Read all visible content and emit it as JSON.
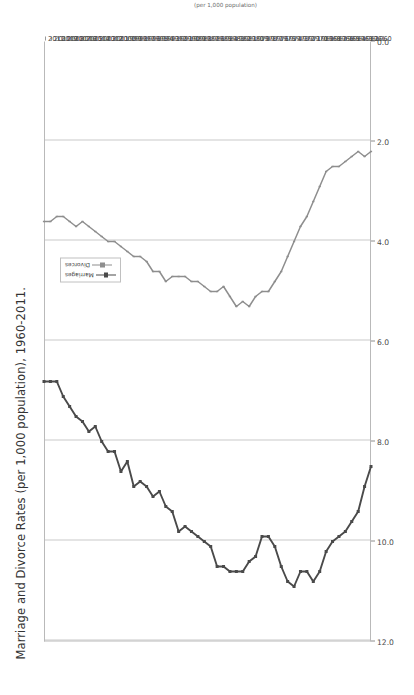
{
  "chart_data": {
    "type": "line",
    "title": "Marriage and Divorce Rates (per 1,000 population), 1960-2011.",
    "xlabel": "",
    "ylabel": "(per 1,000 population)",
    "ylim": [
      0.0,
      12.0
    ],
    "yticks": [
      "12.0",
      "10.0",
      "8.0",
      "6.0",
      "4.0",
      "2.0",
      "0.0"
    ],
    "ytick_values": [
      12.0,
      10.0,
      8.0,
      6.0,
      4.0,
      2.0,
      0.0
    ],
    "grid": true,
    "legend_position": "upper-left",
    "orientation": "rotated-90",
    "categories": [
      "1960",
      "1961",
      "1962",
      "1963",
      "1964",
      "1965",
      "1966",
      "1967",
      "1968",
      "1969",
      "1970",
      "1971",
      "1972",
      "1973",
      "1974",
      "1975",
      "1976",
      "1977",
      "1978",
      "1979",
      "1980",
      "1981",
      "1982",
      "1983",
      "1984",
      "1985",
      "1986",
      "1987",
      "1988",
      "1989",
      "1990",
      "1991",
      "1992",
      "1993",
      "1994",
      "1995",
      "1996",
      "1997",
      "1998",
      "1999",
      "2000",
      "2001",
      "2002",
      "2003",
      "2004",
      "2005",
      "2006",
      "2007",
      "2008",
      "2009",
      "2010",
      "2011"
    ],
    "series": [
      {
        "name": "Marriages",
        "color": "#4a4a4a",
        "marker": "square",
        "values": [
          8.5,
          8.9,
          9.4,
          9.6,
          9.8,
          9.9,
          10.0,
          10.2,
          10.6,
          10.8,
          10.6,
          10.6,
          10.9,
          10.8,
          10.5,
          10.1,
          9.9,
          9.9,
          10.3,
          10.4,
          10.6,
          10.6,
          10.6,
          10.5,
          10.5,
          10.1,
          10.0,
          9.9,
          9.8,
          9.7,
          9.8,
          9.4,
          9.3,
          9.0,
          9.1,
          8.9,
          8.8,
          8.9,
          8.4,
          8.6,
          8.2,
          8.2,
          8.0,
          7.7,
          7.8,
          7.6,
          7.5,
          7.3,
          7.1,
          6.8,
          6.8,
          6.8
        ]
      },
      {
        "name": "Divorces",
        "color": "#8e8e8e",
        "marker": "tick",
        "values": [
          2.2,
          2.3,
          2.2,
          2.3,
          2.4,
          2.5,
          2.5,
          2.6,
          2.9,
          3.2,
          3.5,
          3.7,
          4.0,
          4.3,
          4.6,
          4.8,
          5.0,
          5.0,
          5.1,
          5.3,
          5.2,
          5.3,
          5.1,
          4.9,
          5.0,
          5.0,
          4.9,
          4.8,
          4.8,
          4.7,
          4.7,
          4.7,
          4.8,
          4.6,
          4.6,
          4.4,
          4.3,
          4.3,
          4.2,
          4.1,
          4.0,
          4.0,
          3.9,
          3.8,
          3.7,
          3.6,
          3.7,
          3.6,
          3.5,
          3.5,
          3.6,
          3.6
        ]
      }
    ]
  },
  "title": {
    "text": "Marriage and Divorce Rates (per 1,000 population), 1960-2011."
  },
  "legend": {
    "items": [
      {
        "label": "Marriages"
      },
      {
        "label": "Divorces"
      }
    ]
  },
  "axis": {
    "value_axis_title": "(per 1,000 population)"
  }
}
